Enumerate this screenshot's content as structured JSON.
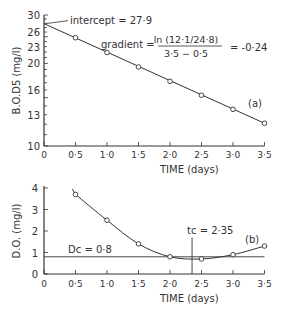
{
  "chart_data": [
    {
      "id": "a",
      "type": "line",
      "panel_label": "(a)",
      "xlabel": "TIME (days)",
      "ylabel": "B.O.D5 (mg/l)",
      "y_scale": "log",
      "ylim": [
        10,
        30
      ],
      "xlim": [
        0,
        3.5
      ],
      "x_ticks": [
        "0",
        "0·5",
        "1·0",
        "1·5",
        "2·0",
        "2·5",
        "3·0",
        "3·5"
      ],
      "y_ticks": [
        "10",
        "13",
        "16",
        "20",
        "23",
        "26",
        "30"
      ],
      "x": [
        0.5,
        1.0,
        1.5,
        2.0,
        2.5,
        3.0,
        3.5
      ],
      "values": [
        24.8,
        21.9,
        19.4,
        17.2,
        15.3,
        13.6,
        12.1
      ],
      "annotations": {
        "intercept": "intercept = 27·9",
        "gradient_label": "gradient =",
        "gradient_num": "ln (12·1/24·8)",
        "gradient_den": "3·5 − 0·5",
        "gradient_result": "= -0·24"
      }
    },
    {
      "id": "b",
      "type": "line",
      "panel_label": "(b)",
      "xlabel": "TIME (days)",
      "ylabel": "D.O. (mg/l)",
      "ylim": [
        0,
        4
      ],
      "xlim": [
        0,
        3.5
      ],
      "x_ticks": [
        "0",
        "0·5",
        "1·0",
        "1·5",
        "2·0",
        "2·5",
        "3·0",
        "3·5"
      ],
      "y_ticks": [
        "0",
        "1",
        "2",
        "3",
        "4"
      ],
      "x": [
        0.5,
        1.0,
        1.5,
        2.0,
        2.5,
        3.0,
        3.5
      ],
      "values": [
        3.7,
        2.5,
        1.4,
        0.8,
        0.7,
        0.9,
        1.3
      ],
      "annotations": {
        "dc": "Dc = 0·8",
        "dc_value": 0.8,
        "tc": "tc = 2·35",
        "tc_value": 2.35
      }
    }
  ]
}
